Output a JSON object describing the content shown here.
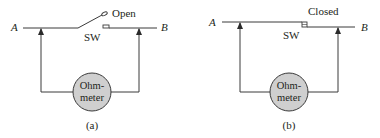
{
  "figure": {
    "panels": [
      {
        "id": "a",
        "caption": "(a)",
        "switch_state": "Open",
        "switch_label": "SW",
        "node_left": "A",
        "node_right": "B",
        "meter_line1": "Ohm-",
        "meter_line2": "meter"
      },
      {
        "id": "b",
        "caption": "(b)",
        "switch_state": "Closed",
        "switch_label": "SW",
        "node_left": "A",
        "node_right": "B",
        "meter_line1": "Ohm-",
        "meter_line2": "meter"
      }
    ],
    "colors": {
      "line": "#3a3a3a",
      "meter_fill": "#cfcfcf",
      "meter_stroke": "#3a3a3a",
      "text": "#231f20"
    }
  }
}
